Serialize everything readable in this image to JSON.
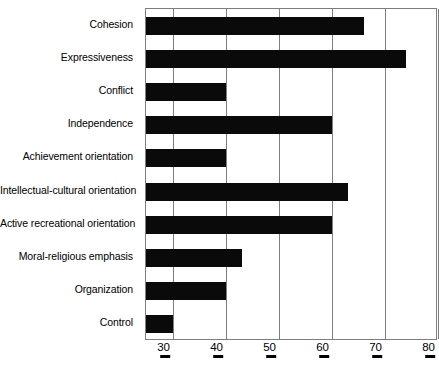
{
  "chart_data": {
    "type": "bar",
    "orientation": "horizontal",
    "title": "",
    "subtitle": "",
    "xlabel": "",
    "ylabel": "",
    "xlim": [
      25,
      80
    ],
    "grid": true,
    "legend": false,
    "xticks": [
      "30",
      "40",
      "50",
      "60",
      "70",
      "80"
    ],
    "xtick_values": [
      30,
      40,
      50,
      60,
      70,
      80
    ],
    "categories": [
      "Cohesion",
      "Expressiveness",
      "Conflict",
      "Independence",
      "Achievement orientation",
      "Intellectual-cultural orientation",
      "Active recreational orientation",
      "Moral-religious emphasis",
      "Organization",
      "Control"
    ],
    "values": [
      66,
      74,
      40,
      60,
      40,
      63,
      60,
      43,
      40,
      30
    ],
    "series": [
      {
        "name": "Scale score",
        "values": [
          66,
          74,
          40,
          60,
          40,
          63,
          60,
          43,
          40,
          30
        ]
      }
    ],
    "bar_color": "#0a0a0a",
    "grid_color": "#7d7d7d",
    "axis_color": "#7d7d7d"
  }
}
